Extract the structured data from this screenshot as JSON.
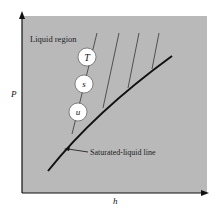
{
  "diagram": {
    "type": "P-h diagram (liquid region)",
    "axes": {
      "y_label": "P",
      "x_label": "h"
    },
    "region_label": "Liquid region",
    "curve_label": "Saturated-liquid line",
    "property_circles": [
      {
        "symbol": "T"
      },
      {
        "symbol": "s"
      },
      {
        "symbol": "u"
      }
    ],
    "colors": {
      "background": "#ffffff",
      "plot_area": "#b9b9b9",
      "lines": "#111111",
      "circle_fill": "#ffffff"
    }
  }
}
